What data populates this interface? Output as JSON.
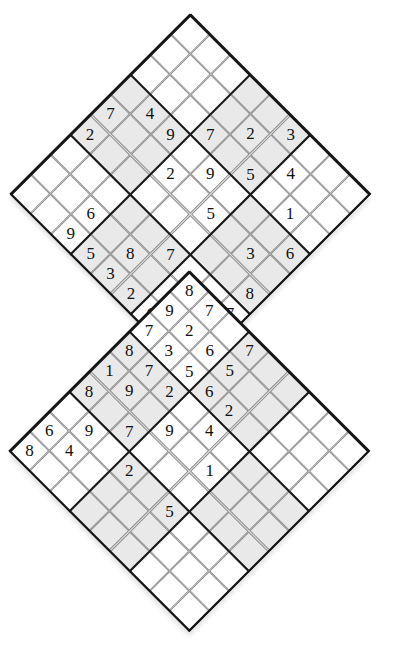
{
  "page": {
    "background_color": "#ffffff",
    "grid_line_color": "#8e8e8e",
    "box_line_color": "#1a1a1a",
    "shaded_cell_color": "#e9e9e9",
    "digit_color": "#111111"
  },
  "layout": {
    "cell_px": 28.3,
    "grids": [
      {
        "name": "top-grid",
        "center_x": 190.5,
        "center_y": 194.0
      },
      {
        "name": "bottom-grid",
        "center_x": 189.5,
        "center_y": 451.0
      }
    ],
    "overlap": "bottom-right 3x3 box of top grid coincides with top-left 3x3 box of bottom grid"
  },
  "grids": {
    "top": {
      "name": "top-grid",
      "rows": 9,
      "cols": 9,
      "clues": [
        {
          "r": 0,
          "c": 5,
          "v": "3"
        },
        {
          "r": 1,
          "c": 4,
          "v": "2"
        },
        {
          "r": 1,
          "c": 6,
          "v": "4"
        },
        {
          "r": 2,
          "c": 3,
          "v": "7"
        },
        {
          "r": 2,
          "c": 5,
          "v": "5"
        },
        {
          "r": 2,
          "c": 7,
          "v": "1"
        },
        {
          "r": 3,
          "c": 1,
          "v": "4"
        },
        {
          "r": 3,
          "c": 2,
          "v": "9"
        },
        {
          "r": 3,
          "c": 4,
          "v": "9"
        },
        {
          "r": 3,
          "c": 8,
          "v": "6"
        },
        {
          "r": 4,
          "c": 0,
          "v": "7"
        },
        {
          "r": 4,
          "c": 3,
          "v": "2"
        },
        {
          "r": 4,
          "c": 5,
          "v": "5"
        },
        {
          "r": 4,
          "c": 7,
          "v": "3"
        },
        {
          "r": 5,
          "c": 0,
          "v": "2"
        },
        {
          "r": 5,
          "c": 8,
          "v": "8"
        },
        {
          "r": 6,
          "c": 5,
          "v": "7"
        },
        {
          "r": 7,
          "c": 2,
          "v": "6"
        },
        {
          "r": 7,
          "c": 7,
          "v": "3"
        },
        {
          "r": 6,
          "c": 8,
          "v": "7"
        },
        {
          "r": 8,
          "c": 8,
          "v": "2"
        },
        {
          "r": 8,
          "c": 7,
          "v": "4"
        },
        {
          "r": 7,
          "c": 4,
          "v": "8"
        },
        {
          "r": 8,
          "c": 2,
          "v": "9"
        },
        {
          "r": 8,
          "c": 3,
          "v": "5"
        },
        {
          "r": 8,
          "c": 6,
          "v": "6"
        },
        {
          "r": 8,
          "c": 5,
          "v": "2"
        },
        {
          "r": 8,
          "c": 4,
          "v": "3"
        }
      ]
    },
    "bottom": {
      "name": "bottom-grid",
      "rows": 9,
      "cols": 9,
      "clues": [
        {
          "r": 0,
          "c": 0,
          "v": "8"
        },
        {
          "r": 0,
          "c": 1,
          "v": "7"
        },
        {
          "r": 1,
          "c": 0,
          "v": "9"
        },
        {
          "r": 2,
          "c": 0,
          "v": "7"
        },
        {
          "r": 1,
          "c": 1,
          "v": "2"
        },
        {
          "r": 2,
          "c": 2,
          "v": "5"
        },
        {
          "r": 0,
          "c": 3,
          "v": "7"
        },
        {
          "r": 1,
          "c": 2,
          "v": "6"
        },
        {
          "r": 2,
          "c": 1,
          "v": "3"
        },
        {
          "r": 1,
          "c": 3,
          "v": "5"
        },
        {
          "r": 3,
          "c": 0,
          "v": "8"
        },
        {
          "r": 2,
          "c": 4,
          "v": "2"
        },
        {
          "r": 3,
          "c": 1,
          "v": "7"
        },
        {
          "r": 2,
          "c": 3,
          "v": "6"
        },
        {
          "r": 3,
          "c": 4,
          "v": "4"
        },
        {
          "r": 4,
          "c": 1,
          "v": "9"
        },
        {
          "r": 3,
          "c": 2,
          "v": "2"
        },
        {
          "r": 4,
          "c": 3,
          "v": "9"
        },
        {
          "r": 4,
          "c": 0,
          "v": "1"
        },
        {
          "r": 5,
          "c": 2,
          "v": "7"
        },
        {
          "r": 4,
          "c": 5,
          "v": "1"
        },
        {
          "r": 5,
          "c": 0,
          "v": "8"
        },
        {
          "r": 6,
          "c": 3,
          "v": "2"
        },
        {
          "r": 6,
          "c": 5,
          "v": "5"
        },
        {
          "r": 6,
          "c": 1,
          "v": "9"
        },
        {
          "r": 7,
          "c": 1,
          "v": "4"
        },
        {
          "r": 7,
          "c": 0,
          "v": "6"
        },
        {
          "r": 8,
          "c": 0,
          "v": "8"
        }
      ]
    }
  }
}
